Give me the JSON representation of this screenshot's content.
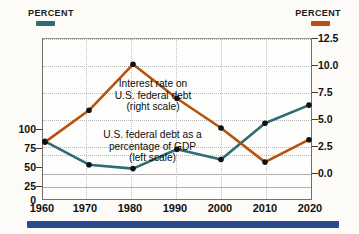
{
  "header": {
    "left_label": "Percent",
    "right_label": "Percent",
    "left_color": "#2e6b73",
    "right_color": "#b4520f"
  },
  "annotations": {
    "interest": {
      "line1": "Interest rate on",
      "line2": "U.S. federal debt",
      "line3": "(right scale)"
    },
    "debt": {
      "line1": "U.S. federal debt as a",
      "line2": "percentage of GDP",
      "line3": "(left scale)"
    }
  },
  "axes": {
    "x_ticks": [
      "1960",
      "1970",
      "1980",
      "1990",
      "2000",
      "2010",
      "2020"
    ],
    "y_left_ticks": [
      "100",
      "75",
      "50",
      "25",
      "0"
    ],
    "y_right_ticks": [
      "12.5",
      "10.0",
      "7.5",
      "5.0",
      "2.5",
      "0.0"
    ]
  },
  "footer": {
    "bar_color": "#2b4b8d"
  },
  "chart_data": {
    "type": "line",
    "title": "",
    "xlabel": "",
    "ylabel": "Percent",
    "grid": true,
    "legend": "annotations-inline",
    "x": [
      1960,
      1970,
      1980,
      1990,
      2000,
      2010,
      2020
    ],
    "categories": [
      "1960",
      "1970",
      "1980",
      "1990",
      "2000",
      "2010",
      "2020"
    ],
    "series": [
      {
        "name": "U.S. federal debt as a percentage of GDP (left scale)",
        "axis": "left",
        "color": "#2e6b73",
        "values": [
          46,
          28,
          25,
          40,
          32,
          60,
          74
        ],
        "ylim": [
          0,
          125
        ],
        "y_ticks": [
          0,
          25,
          50,
          75,
          100
        ]
      },
      {
        "name": "Interest rate on U.S. federal debt (right scale)",
        "axis": "right",
        "color": "#b4520f",
        "values": [
          5.0,
          7.7,
          11.6,
          8.7,
          6.2,
          3.3,
          5.2
        ],
        "ylim": [
          0.0,
          13.75
        ],
        "y_ticks": [
          0.0,
          2.5,
          5.0,
          7.5,
          10.0,
          12.5
        ]
      }
    ]
  }
}
